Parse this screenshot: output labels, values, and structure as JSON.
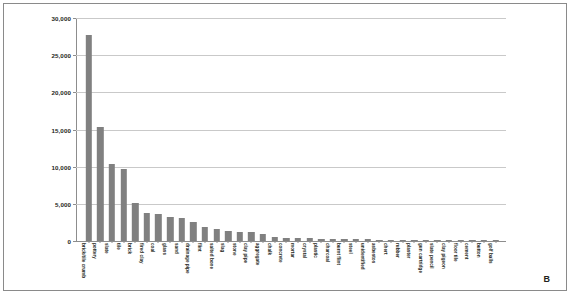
{
  "figure": {
    "panel_label": "B",
    "background": "#ffffff",
    "border_color": "#8a8a8a"
  },
  "chart_data": {
    "type": "bar",
    "title": "",
    "xlabel": "",
    "ylabel": "",
    "ylim": [
      0,
      30000
    ],
    "ytick_values": [
      0,
      5000,
      10000,
      15000,
      20000,
      25000,
      30000
    ],
    "ytick_labels": [
      "0",
      "5,000",
      "10,000",
      "15,000",
      "20,000",
      "25,000",
      "30,000"
    ],
    "grid": true,
    "legend": "none",
    "bar_color": "#808080",
    "categories": [
      "brick/tile crumb",
      "pottery",
      "slate",
      "tile",
      "brick",
      "fired clay",
      "coal",
      "glass",
      "sand",
      "drainage pipe",
      "flint",
      "salted bone",
      "slag",
      "stone",
      "clay pipe",
      "aggregate",
      "chalk",
      "concrete",
      "mortar",
      "crystal",
      "plastic",
      "charcoal",
      "burnt flint",
      "steel",
      "unidentified",
      "asbestos",
      "chert",
      "rubber",
      "plaster",
      "gun cartridge",
      "slate pencil",
      "clay pigeon",
      "floor tile",
      "cement",
      "button",
      "golf balls"
    ],
    "values": [
      27700,
      15400,
      10300,
      9750,
      5050,
      3750,
      3600,
      3200,
      3050,
      2550,
      1950,
      1550,
      1400,
      1250,
      1150,
      950,
      500,
      420,
      380,
      340,
      300,
      270,
      250,
      230,
      210,
      190,
      170,
      150,
      130,
      115,
      100,
      90,
      80,
      70,
      55,
      40
    ]
  }
}
